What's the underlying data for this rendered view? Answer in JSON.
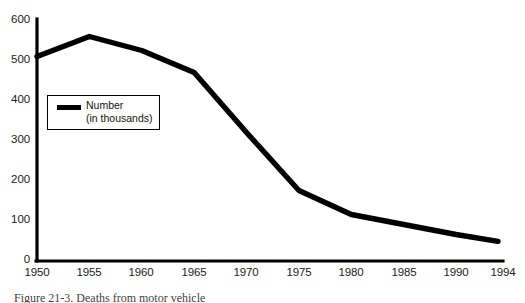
{
  "chart_data": {
    "type": "line",
    "title": "",
    "subtitle": "",
    "xlabel": "",
    "ylabel": "",
    "x": [
      1950,
      1955,
      1960,
      1965,
      1970,
      1975,
      1980,
      1985,
      1990,
      1994
    ],
    "x_tick_labels": [
      "1950",
      "1955",
      "1960",
      "1965",
      "1970",
      "1975",
      "1980",
      "1985",
      "1990",
      "1994"
    ],
    "y_tick_labels": [
      "0",
      "100",
      "200",
      "300",
      "400",
      "500",
      "600"
    ],
    "y_ticks": [
      0,
      100,
      200,
      300,
      400,
      500,
      600
    ],
    "xlim": [
      1950,
      1994
    ],
    "ylim": [
      0,
      600
    ],
    "grid": false,
    "legend_position": "inside-upper-left",
    "series": [
      {
        "name": "Number",
        "units": "in thousands",
        "color": "#000000",
        "values": [
          510,
          560,
          525,
          470,
          320,
          175,
          115,
          90,
          65,
          48
        ]
      }
    ]
  },
  "legend": {
    "line1": "Number",
    "line2": "(in thousands)",
    "swatch_color": "#000000"
  },
  "caption": {
    "text": "Figure 21-3. Deaths from motor vehicle"
  }
}
